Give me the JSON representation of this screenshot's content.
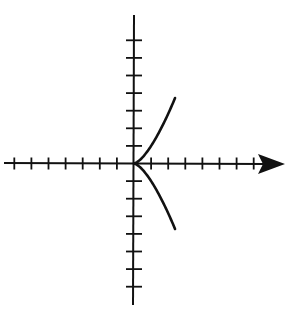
{
  "chart_data": {
    "type": "line",
    "title": "",
    "xlabel": "",
    "ylabel": "",
    "x_ticks_left": 7,
    "x_ticks_right": 7,
    "y_ticks_up": 7,
    "y_ticks_down": 7,
    "xlim": [
      -7.5,
      8.8
    ],
    "ylim": [
      -8.4,
      8.6
    ],
    "grid": false,
    "legend": null,
    "series": [
      {
        "name": "upper branch",
        "x": [
          0,
          0.5,
          1,
          1.5,
          2,
          2.4
        ],
        "y": [
          0,
          0.35,
          1,
          1.84,
          2.83,
          3.72
        ]
      },
      {
        "name": "lower branch",
        "x": [
          0,
          0.5,
          1,
          1.5,
          2,
          2.4
        ],
        "y": [
          0,
          -0.35,
          -1,
          -1.84,
          -2.83,
          -3.72
        ]
      }
    ],
    "colors": {
      "axes": "#111111",
      "curve": "#111111",
      "background": "#ffffff"
    }
  }
}
